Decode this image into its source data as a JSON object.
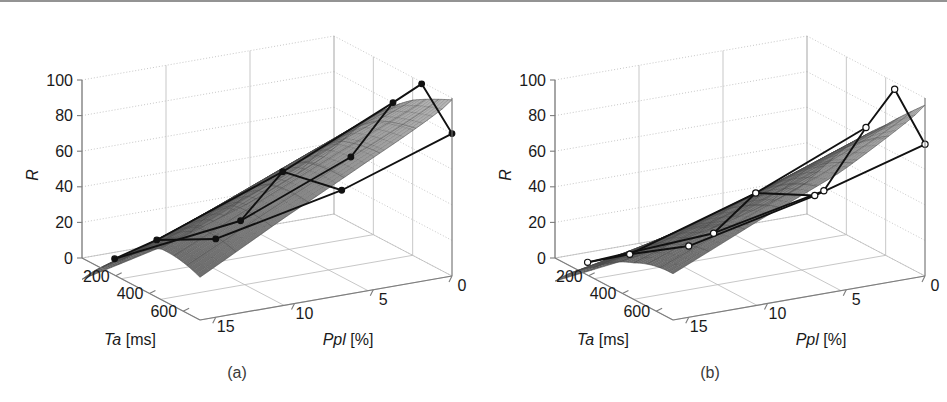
{
  "figure": {
    "background": "#ffffff",
    "axis_color": "#7d7d7d",
    "grid_color": "#b9b9b9",
    "surface_fill_dark": "#7a7a7a",
    "surface_fill_light": "#bdbdbd",
    "mesh_color": "#4a4a4a",
    "overlay_line_color": "#111111"
  },
  "panels": [
    {
      "id": "a",
      "caption": "(a)",
      "marker_style": "filled",
      "marker_fill": "#111111",
      "marker_stroke": "#111111"
    },
    {
      "id": "b",
      "caption": "(b)",
      "marker_style": "open",
      "marker_fill": "#ffffff",
      "marker_stroke": "#111111"
    }
  ],
  "axes": {
    "z": {
      "label": "R",
      "ticks": [
        0,
        20,
        40,
        60,
        80,
        100
      ],
      "tick_labels": [
        "0",
        "20",
        "40",
        "60",
        "80",
        "100"
      ],
      "range": [
        0,
        100
      ]
    },
    "x": {
      "label_main": "Ta",
      "label_unit": "[ms]",
      "label_full": "Ta [ms]",
      "ticks": [
        200,
        400,
        600
      ],
      "tick_labels": [
        "200",
        "400",
        "600"
      ],
      "range": [
        0,
        700
      ]
    },
    "y": {
      "label_main": "Ppl",
      "label_unit": "[%]",
      "label_full": "Ppl [%]",
      "ticks": [
        0,
        5,
        10,
        15
      ],
      "tick_labels": [
        "0",
        "5",
        "10",
        "15"
      ],
      "range": [
        0,
        16
      ]
    }
  },
  "chart_data": [
    {
      "type": "surface",
      "panel": "a",
      "title": "(a)",
      "xlabel": "Ta [ms]",
      "ylabel": "Ppl [%]",
      "zlabel": "R",
      "xlim": [
        0,
        700
      ],
      "ylim": [
        0,
        16
      ],
      "zlim": [
        0,
        100
      ],
      "grid": true,
      "legend": "none",
      "x": [
        100,
        300,
        500,
        700
      ],
      "y": [
        0,
        5,
        10,
        15
      ],
      "z_matrix": [
        [
          37,
          22,
          10,
          2
        ],
        [
          62,
          45,
          28,
          12
        ],
        [
          82,
          66,
          48,
          30
        ],
        [
          99,
          80,
          60,
          38
        ]
      ],
      "marker_points": [
        {
          "Ta": 100,
          "Ppl": 0,
          "R": 37
        },
        {
          "Ta": 100,
          "Ppl": 7,
          "R": 12
        },
        {
          "Ta": 100,
          "Ppl": 15,
          "R": 3
        },
        {
          "Ta": 350,
          "Ppl": 0,
          "R": 80
        },
        {
          "Ta": 350,
          "Ppl": 7,
          "R": 52
        },
        {
          "Ta": 350,
          "Ppl": 15,
          "R": 26
        },
        {
          "Ta": 520,
          "Ppl": 0,
          "R": 99
        },
        {
          "Ta": 700,
          "Ppl": 0,
          "R": 80
        },
        {
          "Ta": 700,
          "Ppl": 7,
          "R": 59
        },
        {
          "Ta": 700,
          "Ppl": 15,
          "R": 44
        }
      ]
    },
    {
      "type": "surface",
      "panel": "b",
      "title": "(b)",
      "xlabel": "Ta [ms]",
      "ylabel": "Ppl [%]",
      "zlabel": "R",
      "xlim": [
        0,
        700
      ],
      "ylim": [
        0,
        16
      ],
      "zlim": [
        0,
        100
      ],
      "grid": true,
      "legend": "none",
      "x": [
        100,
        300,
        500,
        700
      ],
      "y": [
        0,
        5,
        10,
        15
      ],
      "z_matrix": [
        [
          18,
          10,
          4,
          1
        ],
        [
          44,
          30,
          18,
          8
        ],
        [
          68,
          52,
          36,
          22
        ],
        [
          96,
          74,
          58,
          40
        ]
      ],
      "marker_points": [
        {
          "Ta": 100,
          "Ppl": 0,
          "R": 18
        },
        {
          "Ta": 100,
          "Ppl": 7,
          "R": 5
        },
        {
          "Ta": 100,
          "Ppl": 15,
          "R": 1
        },
        {
          "Ta": 350,
          "Ppl": 0,
          "R": 66
        },
        {
          "Ta": 350,
          "Ppl": 7,
          "R": 40
        },
        {
          "Ta": 350,
          "Ppl": 15,
          "R": 18
        },
        {
          "Ta": 520,
          "Ppl": 0,
          "R": 96
        },
        {
          "Ta": 700,
          "Ppl": 0,
          "R": 74
        },
        {
          "Ta": 700,
          "Ppl": 7,
          "R": 56
        },
        {
          "Ta": 700,
          "Ppl": 15,
          "R": 40
        }
      ]
    }
  ]
}
